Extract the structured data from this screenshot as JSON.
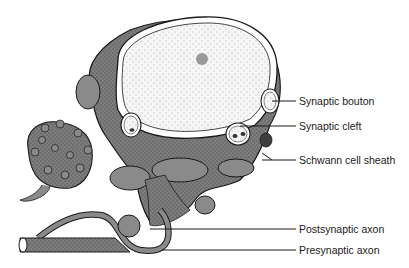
{
  "diagram": {
    "colors": {
      "background": "#ffffff",
      "outline": "#1a1a1a",
      "shaded_tissue": "#8a8a8a",
      "dark_tissue": "#5e5e5e",
      "nucleus_fill": "#f4f4f4",
      "nucleolus": "#9a9a9a"
    },
    "labels": [
      {
        "id": "synaptic-bouton",
        "text": "Synaptic bouton",
        "x": 297,
        "y": 95,
        "line_from_x": 270,
        "line_y": 101
      },
      {
        "id": "synaptic-cleft",
        "text": "Synaptic cleft",
        "x": 297,
        "y": 120,
        "line_from_x": 240,
        "line_y": 126
      },
      {
        "id": "schwann-cell-sheath",
        "text": "Schwann cell sheath",
        "x": 297,
        "y": 155,
        "line_from_x": 262,
        "line_y": 160
      },
      {
        "id": "postsynaptic-axon",
        "text": "Postsynaptic axon",
        "x": 297,
        "y": 223,
        "line_from_x": 150,
        "line_y": 229
      },
      {
        "id": "presynaptic-axon",
        "text": "Presynaptic axon",
        "x": 297,
        "y": 244,
        "line_from_x": 162,
        "line_y": 250
      }
    ]
  }
}
